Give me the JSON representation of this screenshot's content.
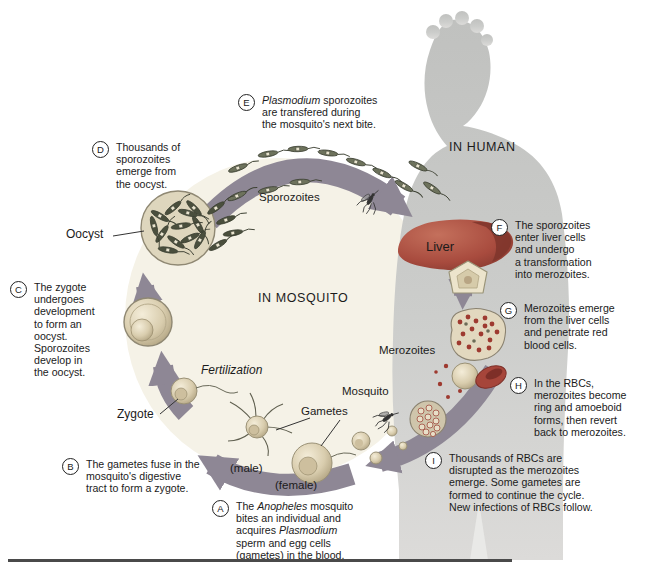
{
  "regions": {
    "human": "IN HUMAN",
    "mosquito": "IN MOSQUITO"
  },
  "labels": {
    "sporozoites": "Sporozoites",
    "oocyst": "Oocyst",
    "zygote": "Zygote",
    "fertilization": "Fertilization",
    "gametes": "Gametes",
    "male": "(male)",
    "female": "(female)",
    "mosquito": "Mosquito",
    "merozoites": "Merozoites",
    "liver": "Liver"
  },
  "steps": {
    "A": {
      "letter": "A",
      "segments": [
        {
          "t": "The "
        },
        {
          "t": "Anopheles",
          "i": true
        },
        {
          "t": " mosquito\nbites an individual and\nacquires "
        },
        {
          "t": "Plasmodium",
          "i": true
        },
        {
          "t": "\nsperm and egg cells\n(gametes) in the blood."
        }
      ]
    },
    "B": {
      "letter": "B",
      "segments": [
        {
          "t": "The gametes fuse in the\nmosquito's digestive\ntract to form a zygote."
        }
      ]
    },
    "C": {
      "letter": "C",
      "segments": [
        {
          "t": "The zygote\nundergoes\ndevelopment\nto form an\noocyst.\nSporozoites\ndevelop in\nthe oocyst."
        }
      ]
    },
    "D": {
      "letter": "D",
      "segments": [
        {
          "t": "Thousands of\nsporozoites\nemerge from\nthe oocyst."
        }
      ]
    },
    "E": {
      "letter": "E",
      "segments": [
        {
          "t": "Plasmodium",
          "i": true
        },
        {
          "t": " sporozoites\nare transfered during\nthe mosquito's next bite."
        }
      ]
    },
    "F": {
      "letter": "F",
      "segments": [
        {
          "t": "The sporozoites\nenter liver cells\nand undergo\na transformation\ninto merozoites."
        }
      ]
    },
    "G": {
      "letter": "G",
      "segments": [
        {
          "t": "Merozoites emerge\nfrom the liver cells\nand penetrate red\nblood cells."
        }
      ]
    },
    "H": {
      "letter": "H",
      "segments": [
        {
          "t": "In the RBCs,\nmerozoites become\nring and amoeboid\nforms, then revert\nback to merozoites."
        }
      ]
    },
    "I": {
      "letter": "I",
      "segments": [
        {
          "t": "Thousands of RBCs are\ndisrupted as the merozoites\nemerge. Some gametes are\nformed to continue the cycle.\nNew infections of RBCs follow."
        }
      ]
    }
  },
  "colors": {
    "arrow": "#8e8795",
    "cycle_interior": "#f5f2e7",
    "human": "#c7c8c6",
    "liver": "#a84b3e",
    "rbc": "#9e3a30",
    "celltan": "#d9cdae",
    "ink": "#1b1b1b"
  }
}
